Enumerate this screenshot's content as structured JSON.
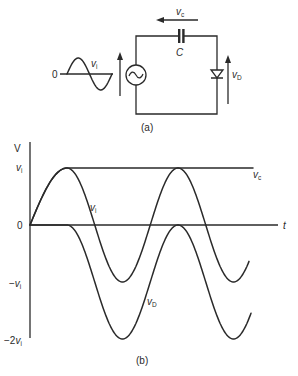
{
  "figure": {
    "part_a": {
      "caption": "(a)",
      "input_waveform": {
        "zero_label": "0",
        "label": "v",
        "label_sub": "i"
      },
      "capacitor": {
        "label": "C",
        "voltage_label": "v",
        "voltage_sub": "c"
      },
      "diode": {
        "voltage_label": "v",
        "voltage_sub": "D"
      },
      "source": {
        "symbol": "~"
      }
    },
    "part_b": {
      "caption": "(b)",
      "y_axis_label": "V",
      "x_axis_label": "t",
      "y_ticks": [
        {
          "text": "v",
          "sub": "i",
          "prefix": "",
          "level": 1
        },
        {
          "text": "0",
          "sub": "",
          "prefix": "",
          "level": 0
        },
        {
          "text": "v",
          "sub": "i",
          "prefix": "−",
          "level": -1
        },
        {
          "text": "v",
          "sub": "i",
          "prefix": "−2",
          "level": -2
        }
      ],
      "curve_labels": {
        "vi": {
          "text": "v",
          "sub": "i"
        },
        "vc": {
          "text": "v",
          "sub": "c"
        },
        "vd": {
          "text": "v",
          "sub": "D"
        }
      }
    }
  },
  "chart_data": {
    "type": "line",
    "xlabel": "t",
    "ylabel": "V",
    "ytick_labels": [
      "vi",
      "0",
      "-vi",
      "-2vi"
    ],
    "y_units": "multiples of vi peak",
    "ylim": [
      -2,
      1
    ],
    "x": [
      0,
      0.25,
      0.5,
      0.75,
      1.0,
      1.25,
      1.5,
      1.75,
      2.0
    ],
    "series": [
      {
        "name": "vi",
        "values": [
          0,
          1,
          0,
          -1,
          0,
          1,
          0,
          -1,
          0
        ]
      },
      {
        "name": "vc",
        "values": [
          0,
          1,
          1,
          1,
          1,
          1,
          1,
          1,
          1
        ]
      },
      {
        "name": "vD",
        "values": [
          0,
          0,
          -1,
          -2,
          -1,
          0,
          -1,
          -2,
          -1
        ]
      }
    ],
    "grid": false,
    "legend": "inline labels"
  }
}
